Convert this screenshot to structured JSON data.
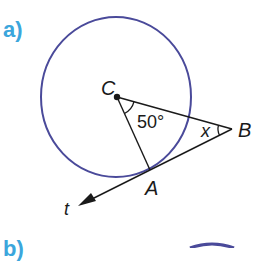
{
  "part_label": "a)",
  "next_part_label": "b)",
  "colors": {
    "part_label": "#3ba6dc",
    "circle": "#4a4a9a",
    "lines": "#1a1a1a"
  },
  "diagram": {
    "points": {
      "C": {
        "label": "C"
      },
      "A": {
        "label": "A"
      },
      "B": {
        "label": "B"
      },
      "t": {
        "label": "t"
      }
    },
    "angle_at_C": "50°",
    "angle_at_B": "x"
  }
}
